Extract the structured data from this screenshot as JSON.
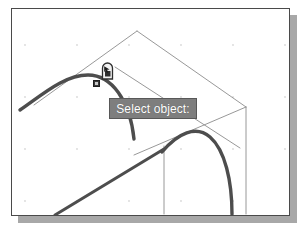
{
  "app": {
    "title": "CAD Drawing Area",
    "background_color": "#ffffff",
    "frame_border_color": "#4a4a4a",
    "shadow_color": "#a8a8a8"
  },
  "prompt": {
    "label": "Select object:",
    "background_color": "#7e7e7e",
    "text_color": "#ffffff",
    "border_color": "#585858"
  },
  "cursor": {
    "name": "pickbox-cursor",
    "kind": "pickbox",
    "x": 96,
    "y": 62
  },
  "grip": {
    "name": "grip-point",
    "state": "unselected",
    "color": "#3a3a3a",
    "x": 84,
    "y": 74
  },
  "drawing": {
    "grid": {
      "visible": true,
      "dot_color": "#d7d7d7",
      "spacing_x": 52,
      "spacing_y": 52
    },
    "entities": [
      {
        "name": "arc-upper-left",
        "type": "arc",
        "style": "thick",
        "color": "#4a4a4a",
        "width": 3.2,
        "selected": true
      },
      {
        "name": "arc-lower-right",
        "type": "arc",
        "style": "thick",
        "color": "#4a4a4a",
        "width": 3.2,
        "selected": false
      },
      {
        "name": "line-diagonal-bottom",
        "type": "line",
        "style": "thick",
        "color": "#4a4a4a",
        "width": 3.0,
        "selected": false
      },
      {
        "name": "construction-edge-top-left",
        "type": "line",
        "style": "thin",
        "color": "#8c8c8c",
        "width": 0.9
      },
      {
        "name": "construction-edge-top-right",
        "type": "line",
        "style": "thin",
        "color": "#8c8c8c",
        "width": 0.9
      },
      {
        "name": "construction-edge-right",
        "type": "line",
        "style": "thin",
        "color": "#8c8c8c",
        "width": 0.9
      },
      {
        "name": "construction-diagonal-a",
        "type": "line",
        "style": "thin",
        "color": "#8c8c8c",
        "width": 0.9
      },
      {
        "name": "construction-diagonal-b",
        "type": "line",
        "style": "thin",
        "color": "#8c8c8c",
        "width": 0.9
      },
      {
        "name": "construction-vertical",
        "type": "line",
        "style": "thin",
        "color": "#8c8c8c",
        "width": 0.9
      }
    ]
  }
}
